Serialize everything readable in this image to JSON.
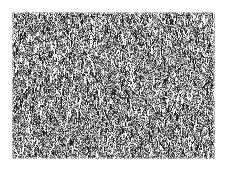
{
  "image": {
    "description": "Grayscale high-frequency noise texture with faint streaks, framed by a white border",
    "region": {
      "x": 12,
      "y": 12,
      "width": 203,
      "height": 147
    },
    "colors": {
      "background": "#ffffff",
      "texture_dark": "#1e1e1e",
      "texture_mid": "#7a7a7a",
      "texture_light": "#f0f0f0"
    }
  }
}
